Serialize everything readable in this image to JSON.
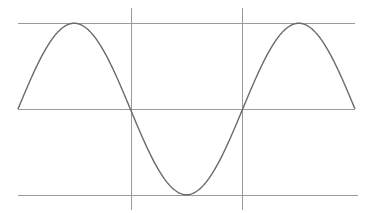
{
  "chart_data": {
    "type": "line",
    "title": "",
    "xlabel": "",
    "ylabel": "",
    "function": "sine",
    "periods": 1.5,
    "x": [
      0,
      0.25,
      0.5,
      0.75,
      1.0,
      1.25,
      1.5
    ],
    "values": [
      0,
      1,
      0,
      -1,
      0,
      1,
      0
    ],
    "ylim": [
      -1,
      1
    ],
    "xlim": [
      0,
      1.5
    ],
    "grid": {
      "horizontal_lines_at": [
        1,
        0,
        -1
      ],
      "vertical_lines_at": [
        0.5,
        1.0
      ]
    },
    "legend": null,
    "colors": {
      "curve": "#6a6a6a",
      "guides": "#9a9a9a",
      "background": "#ffffff"
    }
  },
  "layout": {
    "plot_left": 18,
    "plot_right": 355,
    "y_top": 23.5,
    "y_zero": 109,
    "y_bottom": 195,
    "vline_top": 8,
    "vline_bottom": 210,
    "vlines_x": [
      131,
      242
    ],
    "bottom_line_right": 358,
    "samples": 240
  }
}
